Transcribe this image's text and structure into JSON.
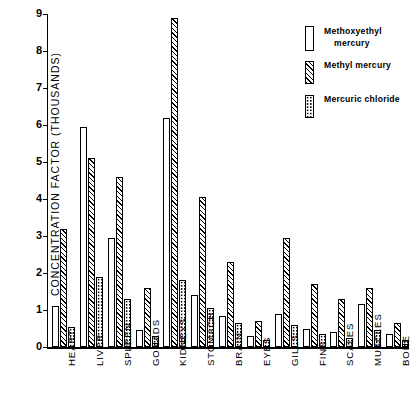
{
  "chart_data": {
    "type": "bar",
    "title": "",
    "xlabel": "",
    "ylabel": "CONCENTRATION   FACTOR   (THOUSANDS)",
    "ylim": [
      0,
      9
    ],
    "yticks": [
      0,
      1,
      2,
      3,
      4,
      5,
      6,
      7,
      8,
      9
    ],
    "ytick_labels": [
      "0",
      "1",
      "2",
      "3",
      "4",
      "5",
      "6",
      "7",
      "8",
      "9"
    ],
    "grid": false,
    "legend_position": "top-right",
    "categories": [
      "HEART",
      "LIVER",
      "SPLEEN",
      "GONADS",
      "KIDNEYS",
      "STOMACH",
      "BRAIN",
      "EYES",
      "GILLS",
      "FINS",
      "SCALES",
      "MUSCLES",
      "BONE"
    ],
    "series": [
      {
        "name": "Methoxyethyl mercury",
        "pattern": "plain",
        "values": [
          1.1,
          5.95,
          2.95,
          0.45,
          6.2,
          1.4,
          0.85,
          0.3,
          0.9,
          0.5,
          0.4,
          1.15,
          0.35
        ]
      },
      {
        "name": "Methyl mercury",
        "pattern": "diagonal-hatch",
        "values": [
          3.2,
          5.1,
          4.6,
          1.6,
          8.9,
          4.05,
          2.3,
          0.7,
          2.95,
          1.7,
          1.3,
          1.6,
          0.65
        ]
      },
      {
        "name": "Mercuric chloride",
        "pattern": "dots",
        "values": [
          0.55,
          1.9,
          1.3,
          0.3,
          1.8,
          1.05,
          0.65,
          0.2,
          0.6,
          0.35,
          0.25,
          0.45,
          0.2
        ]
      }
    ]
  },
  "legend": {
    "entries": [
      {
        "line1": "Methoxyethyl",
        "line2": "mercury"
      },
      {
        "line1": "Methyl  mercury",
        "line2": ""
      },
      {
        "line1": "Mercuric  chloride",
        "line2": ""
      }
    ]
  },
  "colors": {
    "ink": "#000000",
    "background": "#ffffff"
  }
}
